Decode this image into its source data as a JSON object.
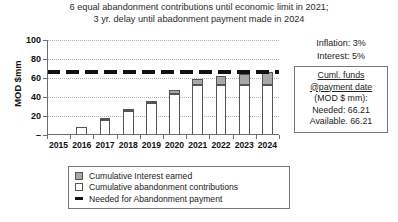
{
  "title": {
    "line1": "6 equal abandonment contributions until economic limit in 2021;",
    "line2": "3 yr. delay until abadonment payment made in 2024"
  },
  "axes": {
    "ylabel": "MOD $mm",
    "yticks": [
      "100",
      "80",
      "60",
      "40",
      "20",
      "–"
    ]
  },
  "annotations": {
    "inflation": "Inflation: 3%",
    "interest": "Interest: 5%"
  },
  "funds_box": {
    "line1": "Cuml. funds",
    "line2": "@payment date",
    "line3": "(MOD $ mm):",
    "line4": "Needed: 66.21",
    "line5": "Available. 66.21"
  },
  "legend": [
    {
      "label": "Cumulative Interest earned",
      "marker": "interest"
    },
    {
      "label": "Cumulative abandonment contributions",
      "marker": "contrib"
    },
    {
      "label": "Needed for Abandonment payment",
      "marker": "needed"
    }
  ],
  "colors": {
    "interest": "#a8a8a8",
    "contributions": "#ffffff",
    "needed_line": "#111111",
    "grid": "#b3b3b3",
    "axis": "#6d6d6d"
  },
  "chart_data": {
    "type": "bar",
    "title": "6 equal abandonment contributions until economic limit in 2021; 3 yr. delay until abadonment payment made in 2024",
    "xlabel": "",
    "ylabel": "MOD $mm",
    "ylim": [
      0,
      100
    ],
    "ytick_values": [
      0,
      20,
      40,
      60,
      80,
      100
    ],
    "grid": true,
    "legend_position": "bottom",
    "stacked": true,
    "categories": [
      "2015",
      "2016",
      "2017",
      "2018",
      "2019",
      "2020",
      "2021",
      "2022",
      "2023",
      "2024"
    ],
    "series": [
      {
        "name": "Cumulative abandonment contributions",
        "values": [
          0,
          8.0,
          16.3,
          24.9,
          33.8,
          43.0,
          52.5,
          52.5,
          52.5,
          52.5
        ]
      },
      {
        "name": "Cumulative Interest earned",
        "values": [
          0,
          0.0,
          0.4,
          1.2,
          2.5,
          4.3,
          6.7,
          9.3,
          12.0,
          13.7
        ]
      }
    ],
    "totals": [
      0,
      8.0,
      16.7,
      26.1,
      36.3,
      47.3,
      59.2,
      61.8,
      64.5,
      66.21
    ],
    "threshold_line": {
      "name": "Needed for Abandonment payment",
      "value": 66.21,
      "style": "dashed"
    }
  }
}
